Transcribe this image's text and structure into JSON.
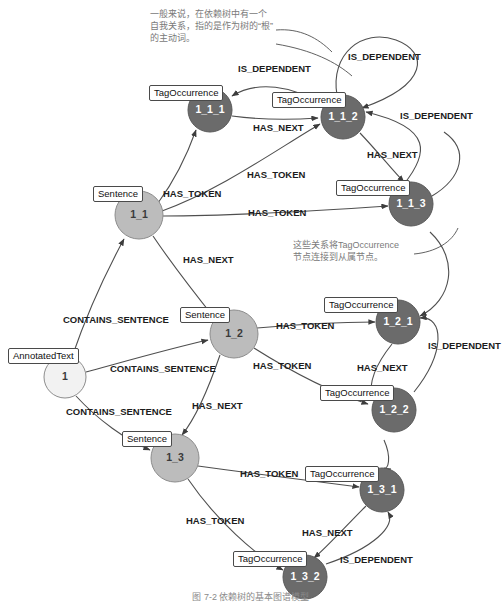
{
  "diagram": {
    "caption": "图 7-2  依赖树的基本图谱模型",
    "colors": {
      "tag_occurrence_fill": "#6b6b6b",
      "sentence_fill": "#bcbcbc",
      "annotated_text_fill": "#f2f2f2",
      "edge_stroke": "#4f4f4f",
      "note_text": "#7a7a7a",
      "label_text": "#1c1c1c"
    },
    "node_types": {
      "annotated_text": "AnnotatedText",
      "sentence": "Sentence",
      "tag_occurrence": "TagOccurrence"
    },
    "relationship_types": {
      "contains_sentence": "CONTAINS_SENTENCE",
      "has_token": "HAS_TOKEN",
      "has_next": "HAS_NEXT",
      "is_dependent": "IS_DEPENDENT"
    },
    "nodes": [
      {
        "id": "n_at_1",
        "label": "1",
        "type": "AnnotatedText",
        "cx": 65,
        "cy": 377,
        "r": 21,
        "fill": "light",
        "tag_x": 8,
        "tag_y": 348
      },
      {
        "id": "n_s_1_1",
        "label": "1_1",
        "type": "Sentence",
        "cx": 139,
        "cy": 215,
        "r": 24,
        "fill": "mid",
        "tag_x": 93,
        "tag_y": 186
      },
      {
        "id": "n_s_1_2",
        "label": "1_2",
        "type": "Sentence",
        "cx": 234,
        "cy": 334,
        "r": 24,
        "fill": "mid",
        "tag_x": 180,
        "tag_y": 307
      },
      {
        "id": "n_s_1_3",
        "label": "1_3",
        "type": "Sentence",
        "cx": 175,
        "cy": 458,
        "r": 24,
        "fill": "mid",
        "tag_x": 122,
        "tag_y": 431
      },
      {
        "id": "n_t_1_1_1",
        "label": "1_1_1",
        "type": "TagOccurrence",
        "cx": 210,
        "cy": 110,
        "r": 22,
        "fill": "dark",
        "tag_x": 149,
        "tag_y": 85
      },
      {
        "id": "n_t_1_1_2",
        "label": "1_1_2",
        "type": "TagOccurrence",
        "cx": 343,
        "cy": 117,
        "r": 22,
        "fill": "dark",
        "tag_x": 272,
        "tag_y": 92
      },
      {
        "id": "n_t_1_1_3",
        "label": "1_1_3",
        "type": "TagOccurrence",
        "cx": 411,
        "cy": 204,
        "r": 22,
        "fill": "dark",
        "tag_x": 336,
        "tag_y": 180
      },
      {
        "id": "n_t_1_2_1",
        "label": "1_2_1",
        "type": "TagOccurrence",
        "cx": 398,
        "cy": 322,
        "r": 22,
        "fill": "dark",
        "tag_x": 324,
        "tag_y": 297
      },
      {
        "id": "n_t_1_2_2",
        "label": "1_2_2",
        "type": "TagOccurrence",
        "cx": 394,
        "cy": 410,
        "r": 22,
        "fill": "dark",
        "tag_x": 320,
        "tag_y": 385
      },
      {
        "id": "n_t_1_3_1",
        "label": "1_3_1",
        "type": "TagOccurrence",
        "cx": 382,
        "cy": 490,
        "r": 22,
        "fill": "dark",
        "tag_x": 305,
        "tag_y": 466
      },
      {
        "id": "n_t_1_3_2",
        "label": "1_3_2",
        "type": "TagOccurrence",
        "cx": 305,
        "cy": 577,
        "r": 22,
        "fill": "dark",
        "tag_x": 233,
        "tag_y": 551
      }
    ],
    "edge_labels": [
      {
        "id": "lbl_cs_1",
        "text": "CONTAINS_SENTENCE",
        "x": 63,
        "y": 320
      },
      {
        "id": "lbl_cs_2",
        "text": "CONTAINS_SENTENCE",
        "x": 110,
        "y": 369
      },
      {
        "id": "lbl_cs_3",
        "text": "CONTAINS_SENTENCE",
        "x": 66,
        "y": 412
      },
      {
        "id": "lbl_ht_1",
        "text": "HAS_TOKEN",
        "x": 163,
        "y": 194
      },
      {
        "id": "lbl_ht_2",
        "text": "HAS_TOKEN",
        "x": 247,
        "y": 175
      },
      {
        "id": "lbl_ht_3",
        "text": "HAS_TOKEN",
        "x": 248,
        "y": 213
      },
      {
        "id": "lbl_ht_4",
        "text": "HAS_TOKEN",
        "x": 276,
        "y": 326
      },
      {
        "id": "lbl_ht_5",
        "text": "HAS_TOKEN",
        "x": 253,
        "y": 366
      },
      {
        "id": "lbl_ht_6",
        "text": "HAS_TOKEN",
        "x": 240,
        "y": 474
      },
      {
        "id": "lbl_ht_7",
        "text": "HAS_TOKEN",
        "x": 186,
        "y": 521
      },
      {
        "id": "lbl_hn_1",
        "text": "HAS_NEXT",
        "x": 253,
        "y": 128
      },
      {
        "id": "lbl_hn_2",
        "text": "HAS_NEXT",
        "x": 367,
        "y": 155
      },
      {
        "id": "lbl_hn_3",
        "text": "HAS_NEXT",
        "x": 183,
        "y": 260
      },
      {
        "id": "lbl_hn_4",
        "text": "HAS_NEXT",
        "x": 357,
        "y": 368
      },
      {
        "id": "lbl_hn_5",
        "text": "HAS_NEXT",
        "x": 192,
        "y": 406
      },
      {
        "id": "lbl_hn_6",
        "text": "HAS_NEXT",
        "x": 302,
        "y": 533
      },
      {
        "id": "lbl_id_1",
        "text": "IS_DEPENDENT",
        "x": 238,
        "y": 69
      },
      {
        "id": "lbl_id_2",
        "text": "IS_DEPENDENT",
        "x": 348,
        "y": 57
      },
      {
        "id": "lbl_id_3",
        "text": "IS_DEPENDENT",
        "x": 400,
        "y": 116
      },
      {
        "id": "lbl_id_4",
        "text": "IS_DEPENDENT",
        "x": 428,
        "y": 346
      },
      {
        "id": "lbl_id_5",
        "text": "IS_DEPENDENT",
        "x": 340,
        "y": 560
      }
    ],
    "notes": [
      {
        "id": "note_self_relation",
        "text": "一般来说，在依赖树中有一个\n自我关系，指的是作为树的“根”\n的主动词。",
        "x": 150,
        "y": 8,
        "width": 125
      },
      {
        "id": "note_dependency",
        "text": "这些关系将TagOccurrence\n节点连接到从属节点。",
        "x": 293,
        "y": 239,
        "width": 120
      }
    ]
  }
}
